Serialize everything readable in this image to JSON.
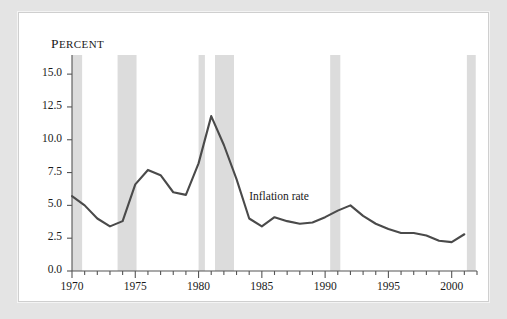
{
  "figure": {
    "axis_title": "Percent",
    "annotation": "Inflation rate",
    "line_color": "#4a4a4a",
    "band_color": "#dcdcdc",
    "axis_color": "#555555",
    "panel_background": "#ffffff",
    "frame_background": "#e4e4e4"
  },
  "chart_data": {
    "type": "line",
    "title": "",
    "xlabel": "",
    "ylabel": "Percent",
    "xlim": [
      1970,
      2002
    ],
    "ylim": [
      0.0,
      16.0
    ],
    "grid": false,
    "legend_position": "inline-annotation",
    "yticks": [
      "0.0",
      "2.5",
      "5.0",
      "7.5",
      "10.0",
      "12.5",
      "15.0"
    ],
    "ytick_values": [
      0.0,
      2.5,
      5.0,
      7.5,
      10.0,
      12.5,
      15.0
    ],
    "xticks": [
      "1970",
      "1975",
      "1980",
      "1985",
      "1990",
      "1995",
      "2000"
    ],
    "xtick_values": [
      1970,
      1975,
      1980,
      1985,
      1990,
      1995,
      2000
    ],
    "xminor_step": 1,
    "series": [
      {
        "name": "Inflation rate",
        "color": "#4a4a4a",
        "x": [
          1970,
          1971,
          1972,
          1973,
          1974,
          1975,
          1976,
          1977,
          1978,
          1979,
          1980,
          1981,
          1982,
          1983,
          1984,
          1985,
          1986,
          1987,
          1988,
          1989,
          1990,
          1991,
          1992,
          1993,
          1994,
          1995,
          1996,
          1997,
          1998,
          1999,
          2000,
          2001
        ],
        "values": [
          5.7,
          5.0,
          4.0,
          3.4,
          3.8,
          6.6,
          7.7,
          7.3,
          6.0,
          5.8,
          8.2,
          11.8,
          9.6,
          7.0,
          4.0,
          3.4,
          4.1,
          3.8,
          3.6,
          3.7,
          4.1,
          4.6,
          5.0,
          4.2,
          3.6,
          3.2,
          2.9,
          2.9,
          2.7,
          2.3,
          2.2,
          2.8
        ]
      }
    ],
    "recession_bands": [
      {
        "start": 1970.0,
        "end": 1970.8
      },
      {
        "start": 1973.6,
        "end": 1975.1
      },
      {
        "start": 1980.0,
        "end": 1980.5
      },
      {
        "start": 1981.3,
        "end": 1982.8
      },
      {
        "start": 1990.4,
        "end": 1991.2
      },
      {
        "start": 2001.2,
        "end": 2001.9
      }
    ]
  }
}
